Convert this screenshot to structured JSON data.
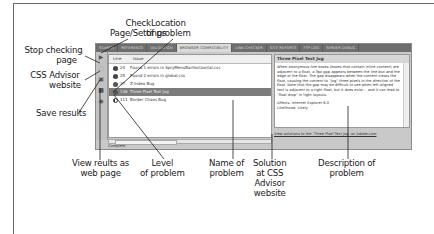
{
  "callouts": {
    "check_page": "Check\nPage/Settings",
    "check_page_l1": "Check",
    "check_page_l2": "Page/Settings",
    "location_l1": "Location",
    "location_l2": "of problem",
    "stop_l1": "Stop checking",
    "stop_l2": "page",
    "css_advisor_l1": "CSS Advisor",
    "css_advisor_l2": "website",
    "save_results": "Save results",
    "view_results_l1": "View reults as",
    "view_results_l2": "web page",
    "level_l1": "Level",
    "level_l2": "of problem",
    "name_l1": "Name of",
    "name_l2": "problem",
    "solution_l1": "Solution",
    "solution_l2": "at CSS",
    "solution_l3": "Advisor",
    "solution_l4": "website",
    "description_l1": "Description of",
    "description_l2": "problem"
  },
  "panel": {
    "tabs": [
      {
        "label": "SEARCH"
      },
      {
        "label": "REFERENCE"
      },
      {
        "label": "VALIDATION"
      },
      {
        "label": "BROWSER COMPATIBILITY",
        "active": true
      },
      {
        "label": "LINK CHECKER"
      },
      {
        "label": "SITE REPORTS"
      },
      {
        "label": "FTP LOG"
      },
      {
        "label": "SERVER DEBUG"
      }
    ],
    "toolbar_icons": [
      "check-page-icon",
      "stop-icon",
      "css-advisor-icon",
      "save-icon",
      "browse-report-icon"
    ],
    "list": {
      "columns": [
        "Line",
        "Issue"
      ],
      "rows": [
        {
          "level": "error",
          "line": "24",
          "issue": "Found 1 errors in SpryMenuBarHorizontal.css"
        },
        {
          "level": "error",
          "line": "25",
          "issue": "Found 2 errors in global.css"
        },
        {
          "level": "warning",
          "line": "37",
          "issue": "Z-Index Bug"
        },
        {
          "level": "warning",
          "line": "136",
          "issue": "Three Pixel Text Jog",
          "selected": true
        },
        {
          "level": "info",
          "line": "111",
          "issue": "Border Chaos Bug"
        }
      ]
    },
    "status": "Complete.",
    "description": {
      "title": "Three Pixel Text Jog",
      "body": "When anonymous line boxes (boxes that contain inline content) are adjacent to a float, a 3px gap appears between the line box and the edge of the float. The gap disappears when the content clears the float, causing the content to \"jog\" three pixels in the direction of the float. Note that the gap may be difficult to see when left-aligned text is adjacent to a right float, but it does exist -- and it can lead to \"float drop\" in tight layouts.",
      "affects": "Affects: Internet Explorer 6.0",
      "likelihood": "Likelihood: Likely",
      "link": "View solutions to the 'Three Pixel Text Jog' on Adobe.com"
    }
  }
}
